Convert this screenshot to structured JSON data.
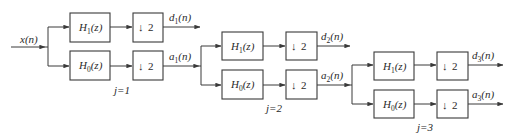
{
  "diagram": {
    "type": "block-diagram",
    "input_label": "x(n)",
    "stages": [
      {
        "j_label": "j=1",
        "highpass": {
          "name": "H",
          "sub": "1",
          "arg": "(z)"
        },
        "lowpass": {
          "name": "H",
          "sub": "0",
          "arg": "(z)"
        },
        "downsample": {
          "symbol": "↓",
          "factor": "2"
        },
        "detail_out": {
          "name": "d",
          "sub": "1",
          "arg": "(n)"
        },
        "approx_out": {
          "name": "a",
          "sub": "1",
          "arg": "(n)"
        }
      },
      {
        "j_label": "j=2",
        "highpass": {
          "name": "H",
          "sub": "1",
          "arg": "(z)"
        },
        "lowpass": {
          "name": "H",
          "sub": "0",
          "arg": "(z)"
        },
        "downsample": {
          "symbol": "↓",
          "factor": "2"
        },
        "detail_out": {
          "name": "d",
          "sub": "2",
          "arg": "(n)"
        },
        "approx_out": {
          "name": "a",
          "sub": "2",
          "arg": "(n)"
        }
      },
      {
        "j_label": "j=3",
        "highpass": {
          "name": "H",
          "sub": "1",
          "arg": "(z)"
        },
        "lowpass": {
          "name": "H",
          "sub": "0",
          "arg": "(z)"
        },
        "downsample": {
          "symbol": "↓",
          "factor": "2"
        },
        "detail_out": {
          "name": "d",
          "sub": "3",
          "arg": "(n)"
        },
        "approx_out": {
          "name": "a",
          "sub": "3",
          "arg": "(n)"
        }
      }
    ]
  }
}
